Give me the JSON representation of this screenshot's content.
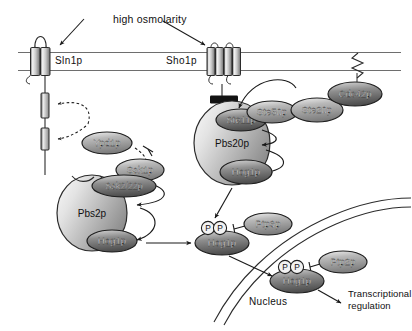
{
  "diagram": {
    "stimulus_label": "high osmolarity",
    "compartments": {
      "nucleus_label": "Nucleus",
      "outcome_label_line1": "Transcriptional",
      "outcome_label_line2": "regulation"
    },
    "membrane_receptors": [
      {
        "name": "Sln1p",
        "label": "Sln1p",
        "segments": 2,
        "x": 46,
        "y": 61
      },
      {
        "name": "Sho1p",
        "label": "Sho1p",
        "segments": 4,
        "x": 227,
        "y": 61
      }
    ],
    "proteins": [
      {
        "id": "ypd1p",
        "label": "Ypd1p",
        "cx": 107,
        "cy": 143,
        "rx": 25,
        "ry": 11,
        "tone": "mid"
      },
      {
        "id": "ssk1p",
        "label": "Ssk1p",
        "cx": 140,
        "cy": 170,
        "rx": 24,
        "ry": 11,
        "tone": "mid"
      },
      {
        "id": "ssk2_22p",
        "label": "Ssk2/22p",
        "cx": 124,
        "cy": 186,
        "rx": 32,
        "ry": 11,
        "tone": "dark"
      },
      {
        "id": "pbs2p",
        "label": "Pbs2p",
        "cx": 92,
        "cy": 213,
        "rx": 37,
        "ry": 38,
        "tone": "scaffold"
      },
      {
        "id": "hog1p_pbs2",
        "label": "Hog1p",
        "cx": 112,
        "cy": 241,
        "rx": 25,
        "ry": 11,
        "tone": "dark"
      },
      {
        "id": "ste11p",
        "label": "Ste11p",
        "cx": 241,
        "cy": 120,
        "rx": 25,
        "ry": 11,
        "tone": "dark"
      },
      {
        "id": "ste50p",
        "label": "Ste50p",
        "cx": 272,
        "cy": 112,
        "rx": 25,
        "ry": 11,
        "tone": "mid"
      },
      {
        "id": "ste20p",
        "label": "Ste20p",
        "cx": 317,
        "cy": 110,
        "rx": 26,
        "ry": 12,
        "tone": "mid"
      },
      {
        "id": "cdc42p",
        "label": "Cdc42p",
        "cx": 355,
        "cy": 94,
        "rx": 27,
        "ry": 12,
        "tone": "dark"
      },
      {
        "id": "pbs20p",
        "label": "Pbs20p",
        "cx": 232,
        "cy": 143,
        "rx": 38,
        "ry": 42,
        "tone": "scaffold"
      },
      {
        "id": "hog1p_pbs20",
        "label": "Hog1p",
        "cx": 246,
        "cy": 172,
        "rx": 26,
        "ry": 12,
        "tone": "dark"
      },
      {
        "id": "hog1p_cyto",
        "label": "Hog1p",
        "cx": 222,
        "cy": 243,
        "rx": 27,
        "ry": 12,
        "tone": "dark"
      },
      {
        "id": "ptp3p",
        "label": "Ptp3p",
        "cx": 268,
        "cy": 224,
        "rx": 24,
        "ry": 11,
        "tone": "mid"
      },
      {
        "id": "hog1p_nuc",
        "label": "Hog1p",
        "cx": 297,
        "cy": 281,
        "rx": 27,
        "ry": 12,
        "tone": "dark"
      },
      {
        "id": "ptp2p",
        "label": "Ptp2p",
        "cx": 343,
        "cy": 262,
        "rx": 24,
        "ry": 11,
        "tone": "mid"
      }
    ],
    "phosphates": [
      {
        "id": "p-cyto-1",
        "label": "P",
        "cx": 208,
        "cy": 228
      },
      {
        "id": "p-cyto-2",
        "label": "P",
        "cx": 220,
        "cy": 228
      },
      {
        "id": "p-nuc-1",
        "label": "P",
        "cx": 285,
        "cy": 267
      },
      {
        "id": "p-nuc-2",
        "label": "P",
        "cx": 297,
        "cy": 267
      }
    ]
  }
}
